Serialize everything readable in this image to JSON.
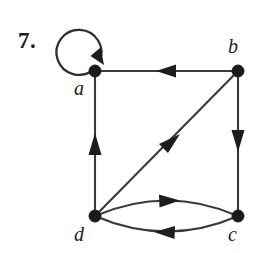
{
  "figure": {
    "problem_number": "7.",
    "caption": "",
    "background_color": "#ffffff",
    "ink_color": "#1d1d1f",
    "edge_color": "#3a3a3c"
  },
  "graph": {
    "type": "directed-graph",
    "vertices": [
      {
        "id": "a",
        "label": "a",
        "x": 95,
        "y": 71,
        "label_x": 74,
        "label_y": 78
      },
      {
        "id": "b",
        "label": "b",
        "x": 238,
        "y": 71,
        "label_x": 228,
        "label_y": 36
      },
      {
        "id": "c",
        "label": "c",
        "x": 238,
        "y": 216,
        "label_x": 228,
        "label_y": 224
      },
      {
        "id": "d",
        "label": "d",
        "x": 95,
        "y": 216,
        "label_x": 74,
        "label_y": 224
      }
    ],
    "edges": [
      {
        "id": "loop-a",
        "from": "a",
        "to": "a",
        "shape": "loop",
        "arrow_direction": "down-right",
        "arrow_x": 97,
        "arrow_y": 55
      },
      {
        "id": "b-to-a",
        "from": "b",
        "to": "a",
        "shape": "straight",
        "arrow_direction": "left",
        "arrow_x": 168,
        "arrow_y": 71
      },
      {
        "id": "d-to-a",
        "from": "d",
        "to": "a",
        "shape": "straight",
        "arrow_direction": "up",
        "arrow_x": 95,
        "arrow_y": 147
      },
      {
        "id": "b-to-c",
        "from": "b",
        "to": "c",
        "shape": "straight",
        "arrow_direction": "down",
        "arrow_x": 238,
        "arrow_y": 140
      },
      {
        "id": "d-to-b",
        "from": "d",
        "to": "b",
        "shape": "straight-diagonal",
        "arrow_direction": "up-right",
        "arrow_x": 170,
        "arrow_y": 145
      },
      {
        "id": "d-to-c",
        "from": "d",
        "to": "c",
        "shape": "curve-upper",
        "arrow_direction": "right",
        "arrow_x": 170,
        "arrow_y": 201
      },
      {
        "id": "c-to-d",
        "from": "c",
        "to": "d",
        "shape": "curve-lower",
        "arrow_direction": "left",
        "arrow_x": 166,
        "arrow_y": 232
      }
    ]
  }
}
